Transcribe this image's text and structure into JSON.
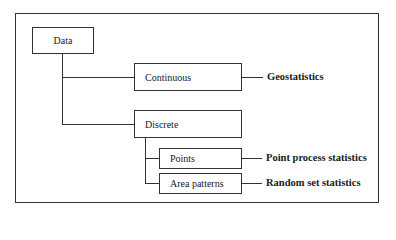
{
  "diagram": {
    "type": "tree",
    "root": {
      "label": "Data",
      "children": [
        {
          "label": "Continuous",
          "leads_to": "Geostatistics"
        },
        {
          "label": "Discrete",
          "children": [
            {
              "label": "Points",
              "leads_to": "Point process statistics"
            },
            {
              "label": "Area patterns",
              "leads_to": "Random set statistics"
            }
          ]
        }
      ]
    }
  },
  "nodes": {
    "data": "Data",
    "continuous": "Continuous",
    "discrete": "Discrete",
    "points": "Points",
    "area_patterns": "Area patterns"
  },
  "outcomes": {
    "geostatistics": "Geostatistics",
    "point_process": "Point process statistics",
    "random_set": "Random set statistics"
  }
}
